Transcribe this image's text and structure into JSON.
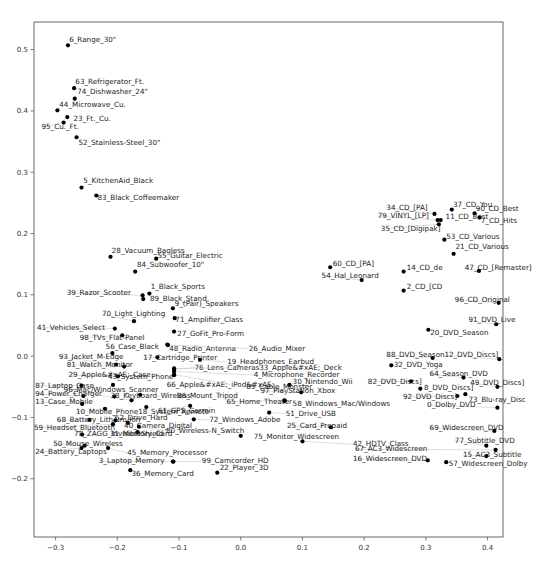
{
  "chart_data": {
    "type": "scatter",
    "title": "",
    "xlabel": "",
    "ylabel": "",
    "xlim": [
      -0.335,
      0.425
    ],
    "ylim": [
      -0.295,
      0.545
    ],
    "grid": false,
    "legend": null,
    "xticks": [
      -0.3,
      -0.2,
      -0.1,
      0.0,
      0.1,
      0.2,
      0.3,
      0.4
    ],
    "xtick_labels": [
      "-0.3",
      "-0.2",
      "-0.1",
      "0.0",
      "0.1",
      "0.2",
      "0.3",
      "0.4"
    ],
    "yticks": [
      -0.2,
      -0.1,
      0.0,
      0.1,
      0.2,
      0.3,
      0.4,
      0.5
    ],
    "ytick_labels": [
      "-0.2",
      "-0.1",
      "0.0",
      "0.1",
      "0.2",
      "0.3",
      "0.4",
      "0.5"
    ],
    "points": [
      {
        "label": "6_Range_30\"",
        "x": -0.28,
        "y": 0.507,
        "lx": -0.278,
        "ly": 0.513
      },
      {
        "label": "63_Refrigerator_Ft.",
        "x": -0.27,
        "y": 0.437,
        "lx": -0.268,
        "ly": 0.444
      },
      {
        "label": "74_Dishwasher_24\"",
        "x": -0.269,
        "y": 0.42,
        "lx": -0.265,
        "ly": 0.427
      },
      {
        "label": "44_Microwave_Cu.",
        "x": -0.297,
        "y": 0.401,
        "lx": -0.294,
        "ly": 0.406
      },
      {
        "label": "23_Ft._Cu.",
        "x": -0.281,
        "y": 0.39,
        "lx": -0.271,
        "ly": 0.383
      },
      {
        "label": "95_Cu._Ft.",
        "x": -0.287,
        "y": 0.381,
        "lx": -0.323,
        "ly": 0.37
      },
      {
        "label": "52_Stainless-Steel_30\"",
        "x": -0.266,
        "y": 0.357,
        "lx": -0.263,
        "ly": 0.345
      },
      {
        "label": "5_KitchenAid_Black",
        "x": -0.258,
        "y": 0.275,
        "lx": -0.255,
        "ly": 0.282
      },
      {
        "label": "83_Black_Coffeemaker",
        "x": -0.234,
        "y": 0.262,
        "lx": -0.232,
        "ly": 0.254
      },
      {
        "label": "28_Vacuum_Bagless",
        "x": -0.211,
        "y": 0.162,
        "lx": -0.209,
        "ly": 0.168
      },
      {
        "label": "55_Guitar_Electric",
        "x": -0.137,
        "y": 0.159,
        "lx": -0.135,
        "ly": 0.16
      },
      {
        "label": "84_Subwoofer_10\"",
        "x": -0.171,
        "y": 0.138,
        "lx": -0.168,
        "ly": 0.145
      },
      {
        "label": "39_Razor_Scooter",
        "x": -0.159,
        "y": 0.099,
        "lx": -0.282,
        "ly": 0.1
      },
      {
        "label": "1_Black_Sports",
        "x": -0.148,
        "y": 0.102,
        "lx": -0.146,
        "ly": 0.11
      },
      {
        "label": "89_Black_Stand",
        "x": -0.158,
        "y": 0.093,
        "lx": -0.147,
        "ly": 0.09
      },
      {
        "label": "9_(Pair)_Speakers",
        "x": -0.11,
        "y": 0.078,
        "lx": -0.107,
        "ly": 0.082
      },
      {
        "label": "70_Light_Lighting",
        "x": -0.173,
        "y": 0.057,
        "lx": -0.225,
        "ly": 0.065
      },
      {
        "label": "71_Amplifier_Class",
        "x": -0.107,
        "y": 0.062,
        "lx": -0.106,
        "ly": 0.055
      },
      {
        "label": "41_Vehicles_Select",
        "x": -0.204,
        "y": 0.045,
        "lx": -0.33,
        "ly": 0.043
      },
      {
        "label": "98_TVs_Flat-Panel",
        "x": -0.192,
        "y": 0.034,
        "lx": -0.261,
        "ly": 0.027
      },
      {
        "label": "27_GoFit_Pro-Form",
        "x": -0.108,
        "y": 0.04,
        "lx": -0.103,
        "ly": 0.033
      },
      {
        "label": "48_Radio_Antenna",
        "x": -0.119,
        "y": 0.019,
        "lx": -0.116,
        "ly": 0.009
      },
      {
        "label": "56_Case_Black",
        "x": -0.208,
        "y": 0.005,
        "lx": -0.219,
        "ly": 0.012
      },
      {
        "label": "17_Cartridge_Printer",
        "x": -0.135,
        "y": -0.002,
        "lx": -0.158,
        "ly": -0.006
      },
      {
        "label": "19_Headphones_Earbud",
        "x": -0.066,
        "y": -0.006,
        "lx": -0.022,
        "ly": -0.013
      },
      {
        "label": "26_Audio_Mixer",
        "x": -0.118,
        "y": 0.018,
        "lx": 0.013,
        "ly": 0.009
      },
      {
        "label": "93_Jacket_M-Edge",
        "x": -0.202,
        "y": -0.014,
        "lx": -0.295,
        "ly": -0.004
      },
      {
        "label": "81_Watch_Monitor",
        "x": -0.189,
        "y": -0.017,
        "lx": -0.282,
        "ly": -0.017
      },
      {
        "label": "76_Lens_Cameras",
        "x": -0.108,
        "y": -0.022,
        "lx": -0.075,
        "ly": -0.022
      },
      {
        "label": "33_Apple&#xAE;_Deck",
        "x": -0.108,
        "y": -0.02,
        "lx": 0.03,
        "ly": -0.022
      },
      {
        "label": "4_Microphone_Recorder",
        "x": -0.108,
        "y": -0.025,
        "lx": 0.021,
        "ly": -0.034
      },
      {
        "label": "29_Apple&#xAE;_Case",
        "x": -0.199,
        "y": -0.033,
        "lx": -0.279,
        "ly": -0.034
      },
      {
        "label": "43_System_Phone",
        "x": -0.207,
        "y": -0.047,
        "lx": -0.215,
        "ly": -0.038
      },
      {
        "label": "66_Apple&#xAE;_iPod&#xAE;",
        "x": -0.108,
        "y": -0.031,
        "lx": -0.12,
        "ly": -0.05
      },
      {
        "label": "30_Nintendo_Wii",
        "x": 0.079,
        "y": -0.047,
        "lx": 0.084,
        "ly": -0.046
      },
      {
        "label": "85_Cable_Monster",
        "x": -0.108,
        "y": -0.03,
        "lx": 0.009,
        "ly": -0.054
      },
      {
        "label": "87_Laptop_Case",
        "x": -0.258,
        "y": -0.048,
        "lx": -0.333,
        "ly": -0.052
      },
      {
        "label": "96_Mac/Windows_Scanner",
        "x": -0.177,
        "y": -0.072,
        "lx": -0.287,
        "ly": -0.058
      },
      {
        "label": "97_PlayStation_Xbox",
        "x": 0.098,
        "y": -0.059,
        "lx": 0.032,
        "ly": -0.06
      },
      {
        "label": "94_Power_Charger",
        "x": -0.255,
        "y": -0.065,
        "lx": -0.333,
        "ly": -0.065
      },
      {
        "label": "38_Keyboard_Wireless",
        "x": -0.205,
        "y": -0.066,
        "lx": -0.211,
        "ly": -0.068
      },
      {
        "label": "86_Mount_Tripod",
        "x": -0.163,
        "y": -0.063,
        "lx": -0.103,
        "ly": -0.069
      },
      {
        "label": "65_Home_Theater",
        "x": 0.071,
        "y": -0.072,
        "lx": -0.023,
        "ly": -0.078
      },
      {
        "label": "58_Windows_Mac/Windows",
        "x": 0.071,
        "y": -0.073,
        "lx": 0.084,
        "ly": -0.081
      },
      {
        "label": "13_Case_Mobile",
        "x": -0.257,
        "y": -0.078,
        "lx": -0.333,
        "ly": -0.078
      },
      {
        "label": "61_GPS_Garmin",
        "x": -0.082,
        "y": -0.081,
        "lx": -0.134,
        "ly": -0.092
      },
      {
        "label": "51_Drive_USB",
        "x": 0.046,
        "y": -0.092,
        "lx": 0.073,
        "ly": -0.097
      },
      {
        "label": "10_Mobile_Phone",
        "x": -0.22,
        "y": -0.086,
        "lx": -0.267,
        "ly": -0.094
      },
      {
        "label": "18_System_Remote",
        "x": -0.153,
        "y": -0.083,
        "lx": -0.166,
        "ly": -0.094
      },
      {
        "label": "72_Windows_Adobe",
        "x": -0.076,
        "y": -0.103,
        "lx": -0.051,
        "ly": -0.107
      },
      {
        "label": "68_Battery_Lithium-Ion",
        "x": -0.245,
        "y": -0.104,
        "lx": -0.298,
        "ly": -0.108
      },
      {
        "label": "62_Drive_Hard",
        "x": -0.203,
        "y": -0.105,
        "lx": -0.204,
        "ly": -0.104
      },
      {
        "label": "40_Camera_Digital",
        "x": -0.183,
        "y": -0.109,
        "lx": -0.189,
        "ly": -0.117
      },
      {
        "label": "25_Card_Prepaid",
        "x": 0.146,
        "y": -0.116,
        "lx": 0.075,
        "ly": -0.117
      },
      {
        "label": "59_Headset_Bluetooth",
        "x": -0.207,
        "y": -0.111,
        "lx": -0.335,
        "ly": -0.12
      },
      {
        "label": "80_Wireless-N_Switch",
        "x": -0.165,
        "y": -0.115,
        "lx": -0.121,
        "ly": -0.125
      },
      {
        "label": "78_ZAGG_InvisibleShield",
        "x": -0.257,
        "y": -0.128,
        "lx": -0.27,
        "ly": -0.131
      },
      {
        "label": "31_Memory_Card",
        "x": -0.167,
        "y": -0.124,
        "lx": -0.212,
        "ly": -0.131
      },
      {
        "label": "75_Monitor_Widescreen",
        "x": 0.0,
        "y": -0.13,
        "lx": 0.021,
        "ly": -0.135
      },
      {
        "label": "42_HDTV_Class",
        "x": 0.1,
        "y": -0.139,
        "lx": 0.182,
        "ly": -0.147
      },
      {
        "label": "50_Mouse_Wireless",
        "x": -0.253,
        "y": -0.146,
        "lx": -0.304,
        "ly": -0.147
      },
      {
        "label": "24_Battery_Laptops",
        "x": -0.258,
        "y": -0.15,
        "lx": -0.333,
        "ly": -0.16
      },
      {
        "label": "45_Memory_Processor",
        "x": -0.215,
        "y": -0.15,
        "lx": -0.184,
        "ly": -0.161
      },
      {
        "label": "3_Laptop_Memory",
        "x": -0.11,
        "y": -0.172,
        "lx": -0.23,
        "ly": -0.175
      },
      {
        "label": "99_Camcorder_HD",
        "x": -0.109,
        "y": -0.172,
        "lx": -0.063,
        "ly": -0.175
      },
      {
        "label": "36_Memory_Card",
        "x": -0.179,
        "y": -0.186,
        "lx": -0.177,
        "ly": -0.195
      },
      {
        "label": "22_Player_3D",
        "x": -0.038,
        "y": -0.19,
        "lx": -0.034,
        "ly": -0.186
      },
      {
        "label": "34_CD_[PA]",
        "x": 0.314,
        "y": 0.232,
        "lx": 0.236,
        "ly": 0.239
      },
      {
        "label": "37_CD_You",
        "x": 0.342,
        "y": 0.239,
        "lx": 0.344,
        "ly": 0.244
      },
      {
        "label": "90_CD_Best",
        "x": 0.379,
        "y": 0.233,
        "lx": 0.381,
        "ly": 0.237
      },
      {
        "label": "79_VINYL_[LP]",
        "x": 0.319,
        "y": 0.222,
        "lx": 0.222,
        "ly": 0.225
      },
      {
        "label": "11_CD_Best",
        "x": 0.324,
        "y": 0.222,
        "lx": 0.332,
        "ly": 0.224
      },
      {
        "label": "7_CD_Hits",
        "x": 0.387,
        "y": 0.226,
        "lx": 0.389,
        "ly": 0.217
      },
      {
        "label": "35_CD_[Digipak]",
        "x": 0.321,
        "y": 0.215,
        "lx": 0.227,
        "ly": 0.204
      },
      {
        "label": "53_CD_Various",
        "x": 0.33,
        "y": 0.19,
        "lx": 0.333,
        "ly": 0.191
      },
      {
        "label": "21_CD_Various",
        "x": 0.345,
        "y": 0.167,
        "lx": 0.348,
        "ly": 0.174
      },
      {
        "label": "60_CD_[PA]",
        "x": 0.145,
        "y": 0.145,
        "lx": 0.149,
        "ly": 0.147
      },
      {
        "label": "14_CD_de",
        "x": 0.264,
        "y": 0.138,
        "lx": 0.269,
        "ly": 0.14
      },
      {
        "label": "47_CD_[Remaster]",
        "x": 0.386,
        "y": 0.139,
        "lx": 0.363,
        "ly": 0.14
      },
      {
        "label": "54_Hal_Leonard",
        "x": 0.196,
        "y": 0.124,
        "lx": 0.131,
        "ly": 0.128
      },
      {
        "label": "2_CD_[CD",
        "x": 0.264,
        "y": 0.107,
        "lx": 0.269,
        "ly": 0.11
      },
      {
        "label": "96_CD_Original",
        "x": 0.418,
        "y": 0.087,
        "lx": 0.347,
        "ly": 0.089
      },
      {
        "label": "91_DVD_Live",
        "x": 0.414,
        "y": 0.052,
        "lx": 0.369,
        "ly": 0.055
      },
      {
        "label": "20_DVD_Season",
        "x": 0.304,
        "y": 0.043,
        "lx": 0.307,
        "ly": 0.035
      },
      {
        "label": "88_DVD_Season",
        "x": 0.311,
        "y": -0.003,
        "lx": 0.236,
        "ly": -0.002
      },
      {
        "label": "12_DVD_Discs]",
        "x": 0.419,
        "y": -0.005,
        "lx": 0.33,
        "ly": -0.002
      },
      {
        "label": "32_DVD_Yoga",
        "x": 0.244,
        "y": -0.015,
        "lx": 0.248,
        "ly": -0.018
      },
      {
        "label": "64_Season_DVD",
        "x": 0.361,
        "y": -0.035,
        "lx": 0.306,
        "ly": -0.033
      },
      {
        "label": "82_DVD_Discs]",
        "x": 0.276,
        "y": -0.041,
        "lx": 0.206,
        "ly": -0.045
      },
      {
        "label": "49_DVD_Discs]",
        "x": 0.416,
        "y": -0.05,
        "lx": 0.372,
        "ly": -0.047
      },
      {
        "label": "8_DVD_Discs]",
        "x": 0.291,
        "y": -0.053,
        "lx": 0.297,
        "ly": -0.056
      },
      {
        "label": "92_DVD_Discs]",
        "x": 0.351,
        "y": -0.065,
        "lx": 0.263,
        "ly": -0.07
      },
      {
        "label": "73_Blu-ray_Disc",
        "x": 0.364,
        "y": -0.062,
        "lx": 0.369,
        "ly": -0.074
      },
      {
        "label": "0_Dolby_DVD",
        "x": 0.416,
        "y": -0.084,
        "lx": 0.302,
        "ly": -0.083
      },
      {
        "label": "69_Widescreen_DVD",
        "x": 0.411,
        "y": -0.122,
        "lx": 0.306,
        "ly": -0.121
      },
      {
        "label": "77_Subtitle_DVD",
        "x": 0.398,
        "y": -0.146,
        "lx": 0.347,
        "ly": -0.141
      },
      {
        "label": "67_AC3_Widescreen",
        "x": 0.413,
        "y": -0.153,
        "lx": 0.185,
        "ly": -0.155
      },
      {
        "label": "15_AC3_Subtitle",
        "x": 0.398,
        "y": -0.163,
        "lx": 0.36,
        "ly": -0.165
      },
      {
        "label": "16_Widescreen_DVD",
        "x": 0.303,
        "y": -0.17,
        "lx": 0.182,
        "ly": -0.171
      },
      {
        "label": "57_Widescreen_Dolby",
        "x": 0.333,
        "y": -0.173,
        "lx": 0.337,
        "ly": -0.179
      }
    ]
  }
}
